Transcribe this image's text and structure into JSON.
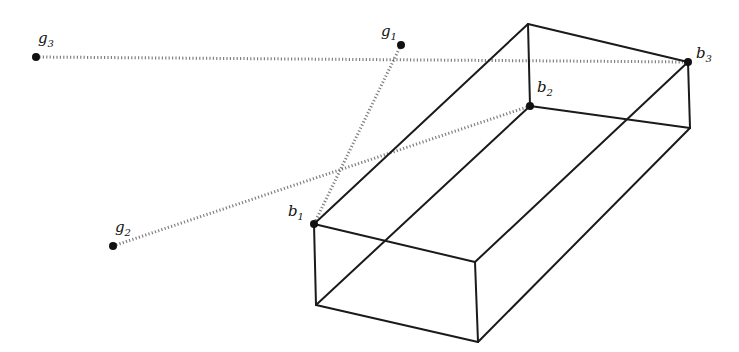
{
  "diagram": {
    "type": "wireframe-box-with-point-correspondences",
    "colors": {
      "edge": "#1a1a1a",
      "dotted": "#555555",
      "point": "#111111",
      "background": "#ffffff"
    },
    "points": {
      "g1": {
        "label": "g",
        "sub": "1",
        "x": 401,
        "y": 45,
        "lx": 381,
        "ly": 36
      },
      "g2": {
        "label": "g",
        "sub": "2",
        "x": 113,
        "y": 246,
        "lx": 115,
        "ly": 232
      },
      "g3": {
        "label": "g",
        "sub": "3",
        "x": 36,
        "y": 57,
        "lx": 38,
        "ly": 43
      },
      "b1": {
        "label": "b",
        "sub": "1",
        "x": 314,
        "y": 224,
        "lx": 288,
        "ly": 216
      },
      "b2": {
        "label": "b",
        "sub": "2",
        "x": 530,
        "y": 106,
        "lx": 537,
        "ly": 92
      },
      "b3": {
        "label": "b",
        "sub": "3",
        "x": 688,
        "y": 62,
        "lx": 696,
        "ly": 58
      }
    },
    "box_vertices": {
      "top_front_left": [
        314,
        224
      ],
      "top_back_left": [
        528,
        24
      ],
      "top_back_right": [
        688,
        62
      ],
      "top_front_right": [
        475,
        262
      ],
      "bottom_front_left": [
        316,
        305
      ],
      "bottom_back_left": [
        530,
        106
      ],
      "bottom_back_right": [
        690,
        128
      ],
      "bottom_front_right": [
        478,
        342
      ]
    },
    "correspondences": [
      {
        "from": "g1",
        "to": "b1"
      },
      {
        "from": "g2",
        "to": "b2"
      },
      {
        "from": "g3",
        "to": "b3"
      }
    ]
  }
}
